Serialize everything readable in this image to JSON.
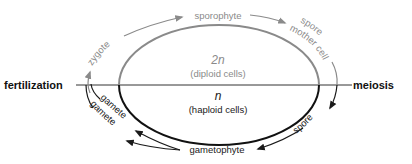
{
  "diagram": {
    "colors": {
      "diploid": "#8a8a8a",
      "haploid": "#1a1a1a",
      "divider": "#333333"
    },
    "events": {
      "left": "fertilization",
      "right": "meiosis"
    },
    "center": {
      "diploid_symbol": "2n",
      "diploid_label": "(diploid cells)",
      "haploid_symbol": "n",
      "haploid_label": "(haploid cells)"
    },
    "cycle_labels": {
      "zygote": "zygote",
      "sporophyte": "sporophyte",
      "spore_mother_cell_1": "spore",
      "spore_mother_cell_2": "mother cell",
      "spore": "spore",
      "gametophyte": "gametophyte",
      "gamete_1": "gamete",
      "gamete_2": "gamete"
    }
  }
}
